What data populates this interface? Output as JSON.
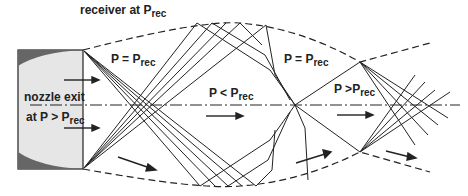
{
  "labels": {
    "receiver": {
      "text": "receiver at P",
      "sub": "rec"
    },
    "nozzle_exit_1": {
      "text": "nozzle exit"
    },
    "nozzle_exit_2": {
      "text": "at P > P",
      "sub": "rec"
    },
    "region1": {
      "text": "P = P",
      "sub": "rec"
    },
    "region2": {
      "text": "P < P",
      "sub": "rec"
    },
    "region3": {
      "text": "P = P",
      "sub": "rec"
    },
    "region4": {
      "text": "P >P",
      "sub": "rec"
    }
  },
  "colors": {
    "line": "#1a1a1a",
    "nozzle_fill": "#e6e6e6",
    "nozzle_wall": "#666666"
  }
}
